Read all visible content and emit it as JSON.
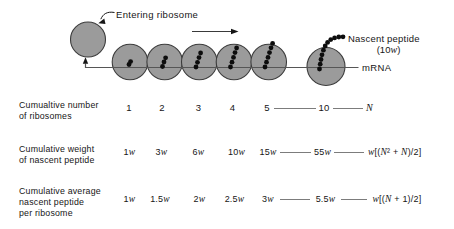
{
  "diagram": {
    "entering_ribosome_label": "Entering ribosome",
    "nascent_peptide_label": "Nascent peptide",
    "nascent_peptide_weight": "(10w)",
    "mrna_label": "mRNA"
  },
  "table": {
    "rows": [
      {
        "label": "Cumualtive number\nof ribosomes",
        "values": [
          "1",
          "2",
          "3",
          "4",
          "5",
          "10",
          "N"
        ]
      },
      {
        "label": "Cumulative weight\nof nascent peptide",
        "values": [
          "1w",
          "3w",
          "6w",
          "10w",
          "15w",
          "55w",
          "w[(N² + N)/2]"
        ]
      },
      {
        "label": "Cumulative average\nnascent peptide\nper ribosome",
        "values": [
          "1w",
          "1.5w",
          "2w",
          "2.5w",
          "3w",
          "5.5w",
          "w[(N + 1)/2]"
        ]
      }
    ]
  }
}
